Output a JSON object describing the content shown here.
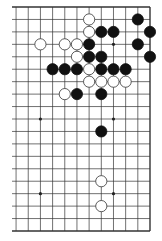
{
  "board": {
    "size": 19,
    "visible_columns": [
      7,
      8,
      9,
      10,
      11,
      12,
      13,
      14,
      15,
      16,
      17,
      18,
      19
    ],
    "visible_rows": [
      1,
      2,
      3,
      4,
      5,
      6,
      7,
      8,
      9,
      10,
      11,
      12,
      13,
      14,
      15,
      16,
      17,
      18,
      19
    ],
    "line_color": "#333333",
    "background": "#ffffff",
    "hoshi": [
      [
        10,
        4
      ],
      [
        16,
        4
      ],
      [
        10,
        10
      ],
      [
        16,
        10
      ],
      [
        10,
        16
      ],
      [
        16,
        16
      ]
    ],
    "stones": [
      {
        "color": "white",
        "col": 14,
        "row": 2
      },
      {
        "color": "black",
        "col": 18,
        "row": 2
      },
      {
        "color": "white",
        "col": 14,
        "row": 3
      },
      {
        "color": "black",
        "col": 15,
        "row": 3
      },
      {
        "color": "black",
        "col": 16,
        "row": 3
      },
      {
        "color": "black",
        "col": 19,
        "row": 3
      },
      {
        "color": "white",
        "col": 10,
        "row": 4
      },
      {
        "color": "white",
        "col": 12,
        "row": 4
      },
      {
        "color": "white",
        "col": 13,
        "row": 4
      },
      {
        "color": "black",
        "col": 14,
        "row": 4
      },
      {
        "color": "black",
        "col": 18,
        "row": 4
      },
      {
        "color": "white",
        "col": 13,
        "row": 5
      },
      {
        "color": "black",
        "col": 14,
        "row": 5
      },
      {
        "color": "black",
        "col": 15,
        "row": 5
      },
      {
        "color": "black",
        "col": 19,
        "row": 5
      },
      {
        "color": "black",
        "col": 11,
        "row": 6
      },
      {
        "color": "black",
        "col": 12,
        "row": 6
      },
      {
        "color": "black",
        "col": 13,
        "row": 6
      },
      {
        "color": "white",
        "col": 14,
        "row": 6
      },
      {
        "color": "black",
        "col": 15,
        "row": 6
      },
      {
        "color": "black",
        "col": 16,
        "row": 6
      },
      {
        "color": "black",
        "col": 17,
        "row": 6
      },
      {
        "color": "white",
        "col": 14,
        "row": 7
      },
      {
        "color": "white",
        "col": 15,
        "row": 7
      },
      {
        "color": "white",
        "col": 16,
        "row": 7
      },
      {
        "color": "white",
        "col": 17,
        "row": 7
      },
      {
        "color": "white",
        "col": 12,
        "row": 8
      },
      {
        "color": "black",
        "col": 13,
        "row": 8
      },
      {
        "color": "black",
        "col": 15,
        "row": 8
      },
      {
        "color": "black",
        "col": 15,
        "row": 11
      },
      {
        "color": "white",
        "col": 15,
        "row": 15
      },
      {
        "color": "white",
        "col": 15,
        "row": 17
      }
    ]
  }
}
